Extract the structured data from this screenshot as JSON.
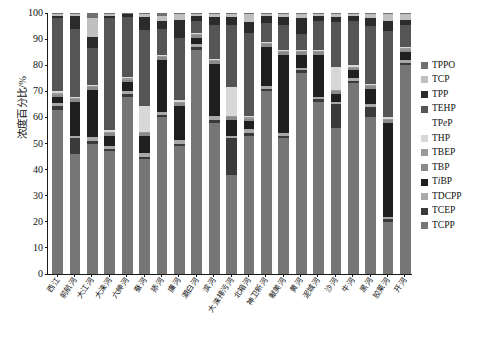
{
  "chart_data": {
    "type": "bar",
    "subtype": "stacked-bar-100-percent",
    "title": "",
    "xlabel": "",
    "ylabel": "浓度百分比/%",
    "ylim": [
      0,
      100
    ],
    "yticks": [
      0,
      10,
      20,
      30,
      40,
      50,
      60,
      70,
      80,
      90,
      100
    ],
    "grid": false,
    "legend_position": "right",
    "stack_order_bottom_to_top": [
      "TCPP",
      "TCEP",
      "TDCPP",
      "TiBP",
      "TBP",
      "TBEP",
      "THP",
      "TPeP",
      "TEHP",
      "TPP",
      "TCP",
      "TPPO"
    ],
    "categories": [
      "西江",
      "前航河",
      "大江河",
      "大涞河",
      "六绅河",
      "蚕河",
      "掭河",
      "廉河",
      "潮白河",
      "滨河",
      "大涞排污河",
      "北箱河",
      "神卫新河",
      "献美河",
      "黄河",
      "泥城河",
      "沙河",
      "牛河",
      "黑河",
      "胶莱河",
      "开河"
    ],
    "series": [
      {
        "name": "TPPO",
        "color": "#707070"
      },
      {
        "name": "TCP",
        "color": "#c0c0c0"
      },
      {
        "name": "TPP",
        "color": "#2b2b2b"
      },
      {
        "name": "TEHP",
        "color": "#555555"
      },
      {
        "name": "TPeP",
        "color": "#ffffff"
      },
      {
        "name": "THP",
        "color": "#d8d8d8"
      },
      {
        "name": "TBEP",
        "color": "#9a9a9a"
      },
      {
        "name": "TBP",
        "color": "#8a8a8a"
      },
      {
        "name": "TiBP",
        "color": "#1f1f1f"
      },
      {
        "name": "TDCPP",
        "color": "#a8a8a8"
      },
      {
        "name": "TCEP",
        "color": "#3a3a3a"
      },
      {
        "name": "TCPP",
        "color": "#767676"
      }
    ],
    "bars": [
      {
        "label": "西江",
        "values": {
          "TCPP": 63.0,
          "TCEP": 1.5,
          "TDCPP": 1.0,
          "TiBP": 2.5,
          "TBP": 0.5,
          "TBEP": 1.0,
          "THP": 0.5,
          "TPeP": 0.0,
          "TEHP": 28.0,
          "TPP": 1.0,
          "TCP": 0.5,
          "TPPO": 0.5
        }
      },
      {
        "label": "前航河",
        "values": {
          "TCPP": 46.0,
          "TCEP": 6.0,
          "TDCPP": 1.0,
          "TiBP": 13.0,
          "TBP": 1.0,
          "TBEP": 0.5,
          "THP": 0.5,
          "TPeP": 0.0,
          "TEHP": 26.0,
          "TPP": 5.0,
          "TCP": 0.5,
          "TPPO": 0.5
        }
      },
      {
        "label": "大江河",
        "values": {
          "TCPP": 50.0,
          "TCEP": 1.0,
          "TDCPP": 1.5,
          "TiBP": 18.0,
          "TBP": 1.0,
          "TBEP": 0.5,
          "THP": 0.5,
          "TPeP": 0.0,
          "TEHP": 14.0,
          "TPP": 4.5,
          "TCP": 7.0,
          "TPPO": 2.0
        }
      },
      {
        "label": "大涞河",
        "values": {
          "TCPP": 47.0,
          "TCEP": 1.0,
          "TDCPP": 1.0,
          "TiBP": 4.0,
          "TBP": 1.0,
          "TBEP": 0.5,
          "THP": 0.5,
          "TPeP": 0.0,
          "TEHP": 43.0,
          "TPP": 1.0,
          "TCP": 0.5,
          "TPPO": 0.5
        }
      },
      {
        "label": "六绅河",
        "values": {
          "TCPP": 68.0,
          "TCEP": 1.0,
          "TDCPP": 1.0,
          "TiBP": 3.5,
          "TBP": 1.0,
          "TBEP": 0.5,
          "THP": 0.5,
          "TPeP": 0.0,
          "TEHP": 23.0,
          "TPP": 1.0,
          "TCP": 0.0,
          "TPPO": 0.5
        }
      },
      {
        "label": "蚕河",
        "values": {
          "TCPP": 44.0,
          "TCEP": 1.0,
          "TDCPP": 1.5,
          "TiBP": 6.5,
          "TBP": 1.0,
          "TBEP": 0.5,
          "THP": 10.0,
          "TPeP": 0.0,
          "TEHP": 29.0,
          "TPP": 5.0,
          "TCP": 1.0,
          "TPPO": 0.5
        }
      },
      {
        "label": "掭河",
        "values": {
          "TCPP": 60.0,
          "TCEP": 1.0,
          "TDCPP": 1.0,
          "TiBP": 20.0,
          "TBP": 1.0,
          "TBEP": 0.5,
          "THP": 0.5,
          "TPeP": 0.0,
          "TEHP": 10.0,
          "TPP": 3.0,
          "TCP": 2.0,
          "TPPO": 1.0
        }
      },
      {
        "label": "廉河",
        "values": {
          "TCPP": 49.0,
          "TCEP": 1.0,
          "TDCPP": 1.5,
          "TiBP": 13.0,
          "TBP": 1.0,
          "TBEP": 0.5,
          "THP": 0.5,
          "TPeP": 0.0,
          "TEHP": 24.0,
          "TPP": 7.0,
          "TCP": 2.0,
          "TPPO": 0.5
        }
      },
      {
        "label": "潮白河",
        "values": {
          "TCPP": 86.0,
          "TCEP": 1.0,
          "TDCPP": 1.0,
          "TiBP": 2.5,
          "TBP": 1.0,
          "TBEP": 0.5,
          "THP": 0.5,
          "TPeP": 0.0,
          "TEHP": 4.5,
          "TPP": 2.0,
          "TCP": 0.5,
          "TPPO": 0.5
        }
      },
      {
        "label": "滨河",
        "values": {
          "TCPP": 58.0,
          "TCEP": 1.0,
          "TDCPP": 1.5,
          "TiBP": 20.0,
          "TBP": 1.0,
          "TBEP": 0.5,
          "THP": 0.5,
          "TPeP": 0.0,
          "TEHP": 13.0,
          "TPP": 3.0,
          "TCP": 1.0,
          "TPPO": 0.5
        }
      },
      {
        "label": "大涞排污河",
        "values": {
          "TCPP": 38.0,
          "TCEP": 14.0,
          "TDCPP": 1.0,
          "TiBP": 6.0,
          "TBP": 1.0,
          "TBEP": 0.5,
          "THP": 11.0,
          "TPeP": 0.0,
          "TEHP": 24.0,
          "TPP": 3.0,
          "TCP": 1.0,
          "TPPO": 0.5
        }
      },
      {
        "label": "北箱河",
        "values": {
          "TCPP": 53.0,
          "TCEP": 1.0,
          "TDCPP": 1.5,
          "TiBP": 3.0,
          "TBP": 1.0,
          "TBEP": 0.5,
          "THP": 0.5,
          "TPeP": 0.0,
          "TEHP": 32.0,
          "TPP": 4.0,
          "TCP": 3.0,
          "TPPO": 0.5
        }
      },
      {
        "label": "神卫新河",
        "values": {
          "TCPP": 70.0,
          "TCEP": 1.0,
          "TDCPP": 1.0,
          "TiBP": 15.0,
          "TBP": 1.0,
          "TBEP": 0.5,
          "THP": 0.5,
          "TPeP": 0.0,
          "TEHP": 7.0,
          "TPP": 3.0,
          "TCP": 0.5,
          "TPPO": 0.5
        }
      },
      {
        "label": "献美河",
        "values": {
          "TCPP": 52.0,
          "TCEP": 1.0,
          "TDCPP": 1.0,
          "TiBP": 30.0,
          "TBP": 1.0,
          "TBEP": 0.5,
          "THP": 0.5,
          "TPeP": 0.0,
          "TEHP": 9.5,
          "TPP": 3.0,
          "TCP": 1.0,
          "TPPO": 0.5
        }
      },
      {
        "label": "黄河",
        "values": {
          "TCPP": 77.0,
          "TCEP": 1.0,
          "TDCPP": 1.0,
          "TiBP": 5.0,
          "TBP": 1.0,
          "TBEP": 0.5,
          "THP": 0.5,
          "TPeP": 0.0,
          "TEHP": 6.0,
          "TPP": 6.0,
          "TCP": 1.5,
          "TPPO": 0.5
        }
      },
      {
        "label": "泥城河",
        "values": {
          "TCPP": 66.0,
          "TCEP": 1.0,
          "TDCPP": 1.0,
          "TiBP": 16.0,
          "TBP": 1.0,
          "TBEP": 0.5,
          "THP": 0.5,
          "TPeP": 0.0,
          "TEHP": 11.0,
          "TPP": 2.0,
          "TCP": 0.5,
          "TPPO": 0.5
        }
      },
      {
        "label": "沙河",
        "values": {
          "TCPP": 56.0,
          "TCEP": 9.0,
          "TDCPP": 1.0,
          "TiBP": 3.0,
          "TBP": 1.0,
          "TBEP": 0.5,
          "THP": 9.0,
          "TPeP": 0.0,
          "TEHP": 17.0,
          "TPP": 2.0,
          "TCP": 1.0,
          "TPPO": 0.5
        }
      },
      {
        "label": "牛河",
        "values": {
          "TCPP": 73.0,
          "TCEP": 1.0,
          "TDCPP": 1.0,
          "TiBP": 3.0,
          "TBP": 1.0,
          "TBEP": 0.5,
          "THP": 0.5,
          "TPeP": 0.0,
          "TEHP": 17.0,
          "TPP": 2.0,
          "TCP": 0.5,
          "TPPO": 0.5
        }
      },
      {
        "label": "黑河",
        "values": {
          "TCPP": 60.0,
          "TCEP": 4.0,
          "TDCPP": 1.0,
          "TiBP": 6.0,
          "TBP": 1.0,
          "TBEP": 0.5,
          "THP": 0.5,
          "TPeP": 0.0,
          "TEHP": 22.0,
          "TPP": 3.0,
          "TCP": 1.5,
          "TPPO": 0.5
        }
      },
      {
        "label": "胶莱河",
        "values": {
          "TCPP": 20.0,
          "TCEP": 1.0,
          "TDCPP": 1.0,
          "TiBP": 36.0,
          "TBP": 1.0,
          "TBEP": 0.5,
          "THP": 0.5,
          "TPeP": 0.0,
          "TEHP": 33.0,
          "TPP": 4.0,
          "TCP": 2.5,
          "TPPO": 0.5
        }
      },
      {
        "label": "开河",
        "values": {
          "TCPP": 80.0,
          "TCEP": 1.0,
          "TDCPP": 1.0,
          "TiBP": 3.0,
          "TBP": 1.0,
          "TBEP": 0.5,
          "THP": 0.5,
          "TPeP": 0.0,
          "TEHP": 8.5,
          "TPP": 2.0,
          "TCP": 2.0,
          "TPPO": 0.5
        }
      }
    ]
  },
  "legend": {
    "entries": [
      {
        "label": "TPPO",
        "key": "TPPO",
        "swatch": true
      },
      {
        "label": "TCP",
        "key": "TCP",
        "swatch": true
      },
      {
        "label": "TPP",
        "key": "TPP",
        "swatch": true
      },
      {
        "label": "TEHP",
        "key": "TEHP",
        "swatch": true
      },
      {
        "label": "TPeP",
        "key": "TPeP",
        "swatch": false
      },
      {
        "label": "THP",
        "key": "THP",
        "swatch": true
      },
      {
        "label": "TBEP",
        "key": "TBEP",
        "swatch": true
      },
      {
        "label": "TBP",
        "key": "TBP",
        "swatch": true
      },
      {
        "label": "TiBP",
        "key": "TiBP",
        "swatch": true
      },
      {
        "label": "TDCPP",
        "key": "TDCPP",
        "swatch": true
      },
      {
        "label": "TCEP",
        "key": "TCEP",
        "swatch": true
      },
      {
        "label": "TCPP",
        "key": "TCPP",
        "swatch": true
      }
    ]
  }
}
